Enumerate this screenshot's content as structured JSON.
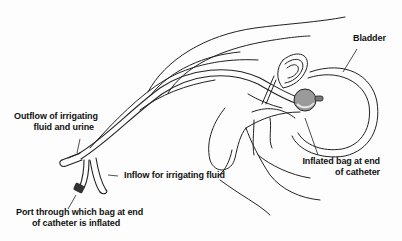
{
  "diagram": {
    "type": "anatomical-illustration",
    "labels": {
      "bladder": "Bladder",
      "outflow_line1": "Outflow of irrigating",
      "outflow_line2": "fluid and urine",
      "inflow": "Inflow for irrigating fluid",
      "port_line1": "Port through which bag at end",
      "port_line2": "of catheter is inflated",
      "bag_line1": "Inflated bag at end",
      "bag_line2": "of catheter"
    },
    "colors": {
      "line": "#222222",
      "balloon": "#9a9a9a",
      "background": "#fdfdfd"
    }
  }
}
